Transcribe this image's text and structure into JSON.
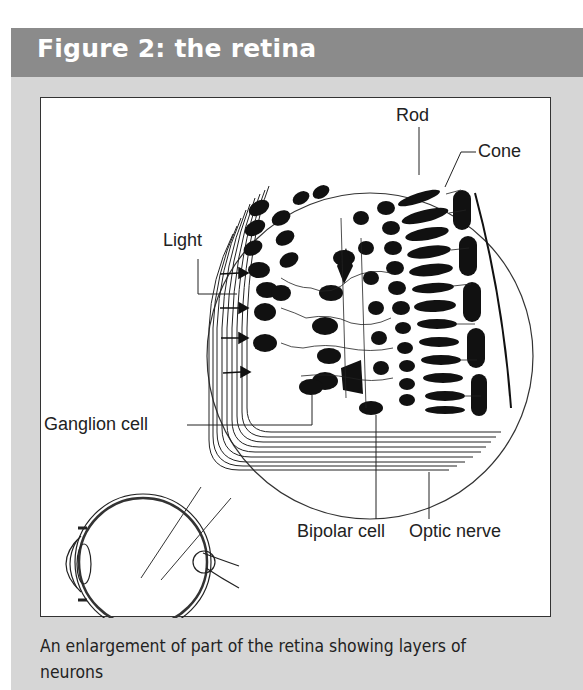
{
  "figure": {
    "title": "Figure 2: the retina",
    "labels": {
      "rod": "Rod",
      "cone": "Cone",
      "light": "Light",
      "ganglion": "Ganglion cell",
      "bipolar": "Bipolar cell",
      "optic_nerve": "Optic nerve"
    },
    "caption": "An enlargement of part of the retina showing layers of neurons"
  },
  "colors": {
    "header_bg": "#8b8b8b",
    "panel_bg": "#d6d6d6",
    "figure_bg": "#ffffff",
    "ink": "#111111"
  }
}
